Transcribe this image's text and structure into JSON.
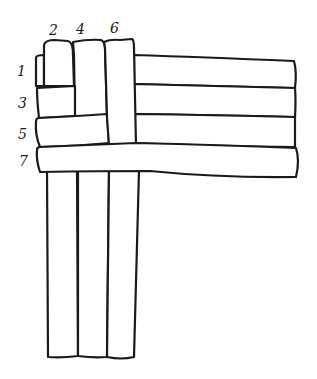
{
  "diagram": {
    "type": "weaving-strips",
    "stroke_color": "#1a1a1a",
    "background": "#ffffff",
    "vertical_strips": [
      {
        "label": "2",
        "order": 1
      },
      {
        "label": "4",
        "order": 2
      },
      {
        "label": "6",
        "order": 3
      }
    ],
    "horizontal_strips": [
      {
        "label": "1",
        "order": 1
      },
      {
        "label": "3",
        "order": 2
      },
      {
        "label": "5",
        "order": 3
      },
      {
        "label": "7",
        "order": 4
      }
    ],
    "labels": {
      "v2": "2",
      "v4": "4",
      "v6": "6",
      "h1": "1",
      "h3": "3",
      "h5": "5",
      "h7": "7"
    }
  }
}
